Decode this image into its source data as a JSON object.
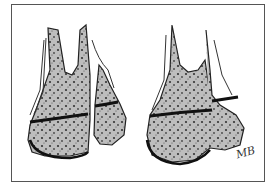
{
  "figure": {
    "left_panel": "Displaced epiphyseal fragment beside metaphysis",
    "right_panel": "Overlapping bone fragments with growth plate lines",
    "signature": "MB",
    "colors": {
      "bone_fill": "#b8b8b8",
      "outline": "#222222",
      "frame": "#555555"
    }
  }
}
